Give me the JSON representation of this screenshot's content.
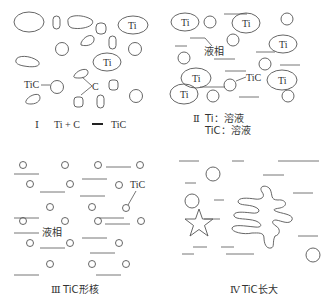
{
  "panels": {
    "p1": {
      "numeral": "Ⅰ",
      "caption_left": "Ti + C",
      "caption_right": "TiC",
      "labels": {
        "ti_a": "Ti",
        "ti_b": "Ti",
        "tic": "TiC",
        "c": "C"
      }
    },
    "p2": {
      "numeral": "Ⅱ",
      "caption_line1": "Ti：溶液",
      "caption_line2": "TiC：溶液",
      "labels": {
        "ti_1": "Ti",
        "ti_2": "Ti",
        "ti_3": "Ti",
        "ti_4": "Ti",
        "ti_5": "Ti",
        "ti_6": "Ti",
        "liquid": "液相",
        "tic": "TiC"
      }
    },
    "p3": {
      "numeral": "Ⅲ",
      "caption": "TiC形核",
      "labels": {
        "tic": "TiC",
        "liquid": "液相"
      }
    },
    "p4": {
      "numeral": "Ⅳ",
      "caption": "TiC长大"
    }
  },
  "colors": {
    "stroke": "#555555",
    "text": "#333333",
    "background": "#ffffff"
  }
}
